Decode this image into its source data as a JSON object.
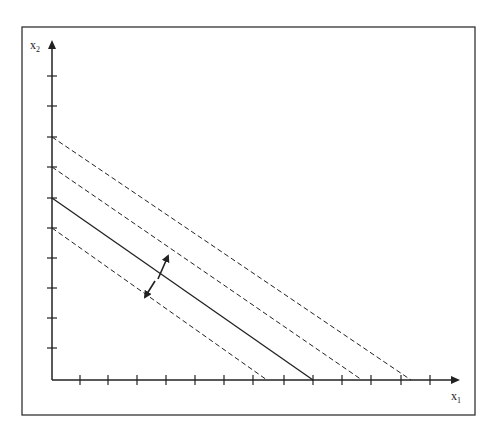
{
  "caption": "",
  "diagram": {
    "type": "budget-line-shifts",
    "frame": {
      "left": 22,
      "top": 27,
      "right": 475,
      "bottom": 415,
      "color": "#333333"
    },
    "axes": {
      "origin": [
        52,
        380
      ],
      "x_end": 458,
      "y_end": 42,
      "x_label": {
        "main": "x",
        "sub": "1"
      },
      "y_label": {
        "main": "x",
        "sub": "2"
      },
      "x_ticks": [
        80,
        108,
        137,
        166,
        195,
        224,
        253,
        284,
        313,
        342,
        371,
        401,
        430
      ],
      "y_ticks": [
        76,
        106,
        137,
        167,
        198,
        228,
        258,
        288,
        318,
        348
      ]
    },
    "lines": [
      {
        "name": "outer-dashed-line",
        "style": "dashed",
        "from": [
          52,
          137
        ],
        "to": [
          411,
          380
        ]
      },
      {
        "name": "middle-dashed-line",
        "style": "dashed",
        "from": [
          52,
          167
        ],
        "to": [
          362,
          380
        ]
      },
      {
        "name": "budget-line",
        "style": "solid",
        "from": [
          52,
          198
        ],
        "to": [
          313,
          380
        ]
      },
      {
        "name": "inner-dashed-line",
        "style": "dashed",
        "from": [
          52,
          228
        ],
        "to": [
          267,
          380
        ]
      }
    ],
    "arrows": [
      {
        "name": "shift-out-arrow",
        "from": [
          158,
          279
        ],
        "to": [
          168,
          256
        ]
      },
      {
        "name": "shift-in-arrow",
        "from": [
          155,
          281
        ],
        "to": [
          145,
          297
        ]
      }
    ],
    "stroke_color": "#222222"
  }
}
